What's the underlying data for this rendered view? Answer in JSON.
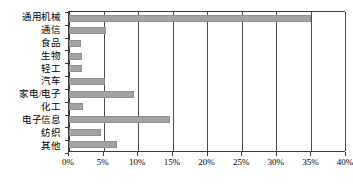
{
  "chart_data": {
    "type": "bar",
    "orientation": "horizontal",
    "title": "",
    "subtitle": "",
    "xlabel": "",
    "ylabel": "",
    "categories": [
      "通用机械",
      "通信",
      "食品",
      "生物",
      "轻工",
      "汽车",
      "家电/电子",
      "化工",
      "电子信息",
      "纺织",
      "其他"
    ],
    "values": [
      35,
      5.4,
      1.8,
      1.9,
      1.9,
      5.2,
      9.4,
      2,
      14.7,
      4.6,
      7
    ],
    "value_unit": "%",
    "xlim": [
      0,
      40
    ],
    "xticks": [
      0,
      5,
      10,
      15,
      20,
      25,
      30,
      35,
      40
    ],
    "xtick_labels": [
      "0%",
      "5%",
      "10%",
      "15%",
      "20%",
      "25%",
      "30%",
      "35%",
      "40%"
    ],
    "grid": true,
    "grid_axis": "x",
    "legend": false,
    "legend_position": "none",
    "series": [
      {
        "name": "",
        "values": [
          35,
          5.4,
          1.8,
          1.9,
          1.9,
          5.2,
          9.4,
          2,
          14.7,
          4.6,
          7
        ]
      }
    ],
    "colors": {
      "bar_fill": "#a3a3a3",
      "bar_stroke": "#8f8f8f",
      "axis": "#3a3a3a",
      "gridline": "#4a4a4a",
      "text": "#000000",
      "background": "#ffffff"
    }
  }
}
